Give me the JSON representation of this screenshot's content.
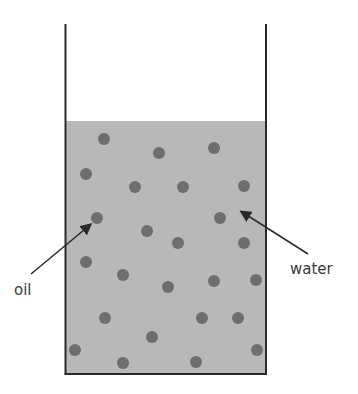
{
  "diagram": {
    "colors": {
      "liquid": "#b8b8b8",
      "droplet": "#6e6e6e",
      "outline": "#2a2a2a",
      "text": "#3a3a3a"
    },
    "beaker": {
      "left": 65,
      "right": 266,
      "top": 24,
      "bottom": 374,
      "liquid_top": 121
    },
    "labels": {
      "oil": "oil",
      "water": "water"
    },
    "droplets": [
      [
        104,
        139
      ],
      [
        159,
        153
      ],
      [
        214,
        148
      ],
      [
        86,
        174
      ],
      [
        135,
        187
      ],
      [
        183,
        187
      ],
      [
        244,
        186
      ],
      [
        97,
        218
      ],
      [
        147,
        231
      ],
      [
        220,
        218
      ],
      [
        178,
        243
      ],
      [
        244,
        243
      ],
      [
        86,
        262
      ],
      [
        123,
        275
      ],
      [
        168,
        287
      ],
      [
        214,
        281
      ],
      [
        256,
        280
      ],
      [
        105,
        318
      ],
      [
        202,
        318
      ],
      [
        238,
        318
      ],
      [
        152,
        337
      ],
      [
        75,
        350
      ],
      [
        257,
        350
      ],
      [
        123,
        363
      ],
      [
        196,
        362
      ]
    ]
  }
}
